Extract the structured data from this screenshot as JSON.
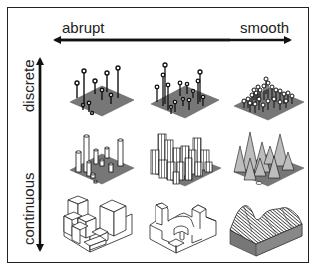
{
  "diagram": {
    "axes": {
      "horizontal": {
        "left_label": "abrupt",
        "right_label": "smooth"
      },
      "vertical": {
        "top_label": "discrete",
        "bottom_label": "continuous"
      }
    },
    "grid": {
      "rows": [
        "discrete (pins)",
        "discrete (cylinders)",
        "continuous (surfaces)"
      ],
      "columns": [
        "abrupt",
        "intermediate",
        "smooth"
      ],
      "panels": [
        {
          "row": 0,
          "col": 0,
          "description": "grey plane with sparse tall pins topped by circles"
        },
        {
          "row": 0,
          "col": 1,
          "description": "grey plane with clustered pins of varied height"
        },
        {
          "row": 0,
          "col": 2,
          "description": "grey plane with dense short white-capped pins"
        },
        {
          "row": 1,
          "col": 0,
          "description": "grey plane with sparse white cylinders of varied height"
        },
        {
          "row": 1,
          "col": 1,
          "description": "grey plane densely packed with striped cylinders"
        },
        {
          "row": 1,
          "col": 2,
          "description": "grey plane with striped smooth conical peaks"
        },
        {
          "row": 2,
          "col": 0,
          "description": "blocky stacked box solid"
        },
        {
          "row": 2,
          "col": 1,
          "description": "rounded carved block solid"
        },
        {
          "row": 2,
          "col": 2,
          "description": "smooth hatched terrain surface on grey base"
        }
      ]
    },
    "colors": {
      "line": "#222222",
      "plane": "#777777",
      "background": "#ffffff"
    }
  }
}
